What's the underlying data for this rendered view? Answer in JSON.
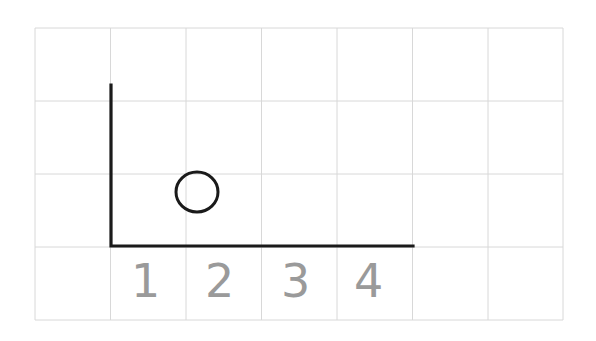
{
  "figure": {
    "background_color": "#ffffff",
    "grid": {
      "line_color": "#d8d8d8",
      "line_width": 1,
      "origin_x": 35,
      "origin_y": 28,
      "cell_width": 75.5,
      "cell_height": 73,
      "columns": 7,
      "rows": 4,
      "vertical_line_x": [
        35,
        110.5,
        186,
        261.5,
        337,
        412.5,
        488,
        563
      ],
      "horizontal_line_y": [
        28,
        101,
        174,
        247,
        320
      ]
    },
    "shapes": {
      "triangle": {
        "name": "right-triangle",
        "stroke_color": "#1a1a1a",
        "stroke_width": 3.2,
        "fill": "none",
        "points": "111,85 111,246 413,246",
        "vertices": [
          {
            "label": "apex",
            "x": 111,
            "y": 85
          },
          {
            "label": "bottom-left",
            "x": 111,
            "y": 246
          },
          {
            "label": "bottom-right",
            "x": 413,
            "y": 246
          }
        ],
        "base_units": 4,
        "height_units": 2.2
      },
      "circle": {
        "name": "hole-circle",
        "stroke_color": "#1a1a1a",
        "stroke_width": 3.0,
        "fill": "none",
        "center_x": 197,
        "center_y": 192,
        "radius_x": 21,
        "radius_y": 20
      }
    },
    "labels": {
      "color": "#9a9a9a",
      "font_size": 46,
      "items": [
        {
          "text": "1",
          "x": 131,
          "y": 258
        },
        {
          "text": "2",
          "x": 205,
          "y": 258
        },
        {
          "text": "3",
          "x": 281,
          "y": 258
        },
        {
          "text": "4",
          "x": 354,
          "y": 258
        }
      ]
    }
  }
}
